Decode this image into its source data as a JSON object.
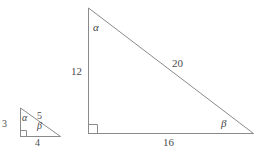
{
  "figure": {
    "type": "geometry-diagram",
    "stroke_color": "#8a8a8a",
    "text_color": "#4a4a4a",
    "background_color": "#ffffff"
  },
  "small_triangle": {
    "name": "small-right-triangle",
    "vertices": {
      "apex": {
        "x": 20,
        "y": 108
      },
      "right_angle": {
        "x": 20,
        "y": 136
      },
      "base_right": {
        "x": 60,
        "y": 136
      }
    },
    "labels": {
      "vertical_leg": "3",
      "hypotenuse": "5",
      "base": "4",
      "angle_apex": "α",
      "angle_base_right": "β"
    },
    "right_angle_marker": true
  },
  "large_triangle": {
    "name": "large-right-triangle",
    "vertices": {
      "apex": {
        "x": 88,
        "y": 8
      },
      "right_angle": {
        "x": 88,
        "y": 133
      },
      "base_right": {
        "x": 253,
        "y": 133
      }
    },
    "labels": {
      "vertical_leg": "12",
      "hypotenuse": "20",
      "base": "16",
      "angle_apex": "α",
      "angle_base_right": "β"
    },
    "right_angle_marker": true
  }
}
